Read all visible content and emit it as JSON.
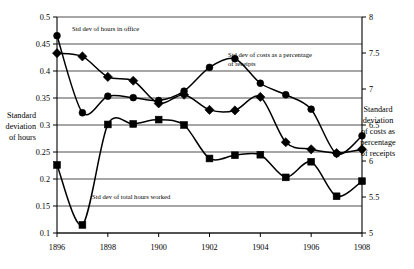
{
  "chart_data": {
    "type": "line",
    "title": "",
    "xlabel": "",
    "ylabel": "Standard deviation of hours",
    "y2label": "Standard deviation of costs as percentage of receipts",
    "grid": true,
    "legend_position": "inline-annotations",
    "x": [
      1896,
      1897,
      1898,
      1899,
      1900,
      1901,
      1902,
      1903,
      1904,
      1905,
      1906,
      1907,
      1908
    ],
    "xlim": [
      1896,
      1908
    ],
    "xticks": [
      "1896",
      "1898",
      "1900",
      "1902",
      "1904",
      "1906",
      "1908"
    ],
    "xtick_values": [
      1896,
      1898,
      1900,
      1902,
      1904,
      1906,
      1908
    ],
    "ylim": [
      0.1,
      0.5
    ],
    "yticks": [
      "0.1",
      "0.15",
      "0.2",
      "0.25",
      "0.3",
      "0.35",
      "0.4",
      "0.45",
      "0.5"
    ],
    "ytick_values": [
      0.1,
      0.15,
      0.2,
      0.25,
      0.3,
      0.35,
      0.4,
      0.45,
      0.5
    ],
    "y2lim": [
      5,
      8
    ],
    "y2ticks": [
      "5",
      "5.5",
      "6",
      "6.5",
      "7",
      "7.5",
      "8"
    ],
    "y2tick_values": [
      5,
      5.5,
      6,
      6.5,
      7,
      7.5,
      8
    ],
    "series": [
      {
        "name": "Std dev of hours in office",
        "axis": "left",
        "marker": "diamond",
        "values": [
          0.433,
          0.427,
          0.389,
          0.382,
          0.34,
          0.356,
          0.328,
          0.327,
          0.352,
          0.268,
          0.255,
          0.248,
          0.255
        ]
      },
      {
        "name": "Std dev of total hours worked",
        "axis": "left",
        "marker": "square",
        "values": [
          0.226,
          0.115,
          0.301,
          0.302,
          0.31,
          0.3,
          0.238,
          0.244,
          0.245,
          0.203,
          0.232,
          0.168,
          0.196
        ]
      },
      {
        "name": "Std dev of costs as a percentage of receipts",
        "axis": "right",
        "marker": "circle",
        "values": [
          7.74,
          6.67,
          6.9,
          6.88,
          6.84,
          6.97,
          7.3,
          7.42,
          7.08,
          6.92,
          6.72,
          6.1,
          6.35
        ]
      }
    ],
    "annotations": [
      {
        "text": "Std dev of hours in office",
        "series": 0
      },
      {
        "text": "Std dev of costs as a percentage",
        "series": 2
      },
      {
        "text": "of receipts",
        "series": 2
      },
      {
        "text": "Std dev of total hours worked",
        "series": 1
      }
    ]
  },
  "left_axis_title": {
    "line1": "Standard",
    "line2": "deviation",
    "line3": "of hours"
  },
  "right_axis_title": {
    "line1": "Standard",
    "line2": "deviation",
    "line3": "of costs as",
    "line4": "percentage",
    "line5": "of receipts"
  }
}
